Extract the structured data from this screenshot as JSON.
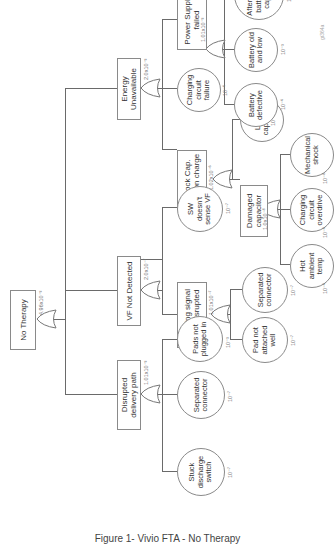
{
  "caption": "Figure 1- Vivio FTA - No Therapy",
  "logo": "gt364a",
  "nodes": {
    "top": {
      "label": "No Therapy",
      "prob": "4.96x10⁻³"
    },
    "vf": {
      "label": "VF Not Detected",
      "prob": "2.0x10⁻⁷"
    },
    "energy": {
      "label": "Energy Unavailable",
      "prob": "2.0x10⁻³"
    },
    "delivery": {
      "label": "Disrupted delivery path",
      "prob": "1.01x10⁻³"
    },
    "sensing": {
      "label": "Sensing signal path disrupted",
      "prob": "1.01x10⁻⁷"
    },
    "sw": {
      "label": "SW doesn't sense VF",
      "prob": "10⁻⁷"
    },
    "stuck": {
      "label": "Stuck discharge switch",
      "prob": "10⁻⁷"
    },
    "sep_conn1": {
      "label": "Separated connector",
      "prob": "10⁻⁷"
    },
    "pads": {
      "label": "Pads not plugged in",
      "prob": "10⁻³"
    },
    "pad_attached": {
      "label": "Pad not attached well",
      "prob": "10⁻⁷"
    },
    "sep_conn2": {
      "label": "Separated connector",
      "prob": "10⁻⁷"
    },
    "shock": {
      "label": "Shock Cap. Low on charge",
      "prob": "1.02x10⁻⁶"
    },
    "charging": {
      "label": "Charging circuit failure",
      "prob": "10⁻⁶"
    },
    "power": {
      "label": "Power Supply failed",
      "prob": "1.01x10⁻³"
    },
    "leaky": {
      "label": "Leaky capacitor",
      "prob": "10⁻⁶"
    },
    "damaged": {
      "label": "Damaged capacitor",
      "prob": "1.0x10⁻⁸"
    },
    "hot": {
      "label": "Hot ambient temp",
      "prob": "10⁻⁶"
    },
    "overdrive": {
      "label": "Charging circuit overdrive",
      "prob": "10⁻⁶"
    },
    "mech": {
      "label": "Mechanical shock",
      "prob": "10⁻⁸"
    },
    "batt_def": {
      "label": "Battery defective",
      "prob": "10⁻⁶"
    },
    "batt_old": {
      "label": "Battery old and low",
      "prob": "10⁻³"
    },
    "aftermarket": {
      "label": "After-market battery,low capacity",
      "prob": "10⁻⁶"
    }
  }
}
